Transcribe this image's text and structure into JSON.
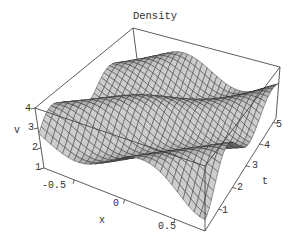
{
  "chart_data": {
    "type": "surface3d",
    "title": "Density",
    "xlabel": "x",
    "ylabel": "t",
    "zlabel": "v",
    "x_ticks": [
      "-0.5",
      "0",
      "0.5"
    ],
    "t_ticks": [
      "1",
      "2",
      "3",
      "4",
      "5"
    ],
    "v_ticks": [
      "1",
      "2",
      "3",
      "4"
    ],
    "x_range": [
      -0.8,
      0.8
    ],
    "t_range": [
      0,
      5.2
    ],
    "v_range": [
      1,
      4
    ],
    "mesh": {
      "nx": 30,
      "nt": 34
    },
    "surface_description": "Wavy density surface v(x,t): two traveling ridges running diagonally, heights ~2 to ~3.9, with a trough between them",
    "colors": {
      "surface": "#a9a9a9",
      "mesh": "#2a2a2a",
      "box": "#333333",
      "text": "#333333"
    },
    "box_corners_px": {
      "xmin_tmin_vmin": [
        44,
        168
      ],
      "xmax_tmin_vmin": [
        205,
        231
      ],
      "xmax_tmax_vmin": [
        276,
        118
      ],
      "xmin_tmax_vmin": [
        141,
        90
      ],
      "xmin_tmin_vmax": [
        35,
        108
      ],
      "xmax_tmin_vmax": [
        205,
        166
      ],
      "xmax_tmax_vmax": [
        280,
        67
      ],
      "xmin_tmax_vmax": [
        133,
        28
      ]
    }
  },
  "labels": {
    "title": "Density",
    "x_axis": "x",
    "t_axis": "t",
    "v_axis": "v"
  }
}
